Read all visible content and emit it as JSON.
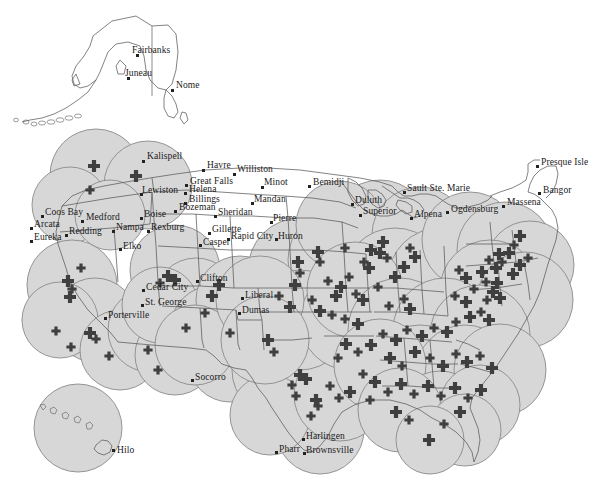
{
  "map": {
    "title": "United States Service Coverage Map",
    "type": "coverage-buffer-map",
    "colors": {
      "buffer_fill": "#d7d7d7",
      "buffer_stroke": "#8a8a8a",
      "state_boundary": "#555555",
      "marker": "#3f3f3f",
      "background": "#ffffff",
      "label_text": "#1a1a1a"
    },
    "legend_note": "",
    "insets": [
      {
        "name": "alaska",
        "label": ""
      },
      {
        "name": "hawaii",
        "label": ""
      }
    ],
    "marker_symbol": "cross",
    "marker_count": 143,
    "labeled_cities": [
      {
        "name": "Fairbanks",
        "x": 137,
        "y": 55,
        "dx": -5,
        "dy": -9,
        "region": "alaska"
      },
      {
        "name": "Juneau",
        "x": 128,
        "y": 78,
        "dx": -3,
        "dy": -9,
        "region": "alaska"
      },
      {
        "name": "Nome",
        "x": 172,
        "y": 90,
        "dx": 4,
        "dy": -9,
        "region": "alaska"
      },
      {
        "name": "Hilo",
        "x": 113,
        "y": 450,
        "dx": 4,
        "dy": -4,
        "region": "hawaii"
      },
      {
        "name": "Kalispell",
        "x": 143,
        "y": 161,
        "dx": 4,
        "dy": -9,
        "region": "west"
      },
      {
        "name": "Havre",
        "x": 203,
        "y": 170,
        "dx": 4,
        "dy": -9,
        "region": "west"
      },
      {
        "name": "Williston",
        "x": 234,
        "y": 174,
        "dx": 3,
        "dy": -9,
        "region": "west"
      },
      {
        "name": "Great Falls",
        "x": 186,
        "y": 185,
        "dx": 4,
        "dy": -8,
        "region": "west"
      },
      {
        "name": "Helena",
        "x": 185,
        "y": 193,
        "dx": 4,
        "dy": -8,
        "region": "west"
      },
      {
        "name": "Lewiston",
        "x": 141,
        "y": 194,
        "dx": 1,
        "dy": -8,
        "region": "west"
      },
      {
        "name": "Billings",
        "x": 185,
        "y": 203,
        "dx": 4,
        "dy": -8,
        "region": "west"
      },
      {
        "name": "Bozeman",
        "x": 175,
        "y": 211,
        "dx": 4,
        "dy": -8,
        "region": "west"
      },
      {
        "name": "Minot",
        "x": 262,
        "y": 187,
        "dx": 2,
        "dy": -9,
        "region": "west"
      },
      {
        "name": "Mandan",
        "x": 252,
        "y": 203,
        "dx": 2,
        "dy": -8,
        "region": "west"
      },
      {
        "name": "Bemidji",
        "x": 309,
        "y": 186,
        "dx": 4,
        "dy": -8,
        "region": "midwest"
      },
      {
        "name": "Sheridan",
        "x": 215,
        "y": 216,
        "dx": 3,
        "dy": -8,
        "region": "west"
      },
      {
        "name": "Sault Ste. Marie",
        "x": 404,
        "y": 192,
        "dx": 3,
        "dy": -8,
        "region": "midwest"
      },
      {
        "name": "Presque Isle",
        "x": 537,
        "y": 166,
        "dx": 4,
        "dy": -8,
        "region": "northeast"
      },
      {
        "name": "Bangor",
        "x": 539,
        "y": 193,
        "dx": 4,
        "dy": -7,
        "region": "northeast"
      },
      {
        "name": "Duluth",
        "x": 352,
        "y": 204,
        "dx": 3,
        "dy": -8,
        "region": "midwest"
      },
      {
        "name": "Superior",
        "x": 360,
        "y": 215,
        "dx": 3,
        "dy": -8,
        "region": "midwest"
      },
      {
        "name": "Alpena",
        "x": 411,
        "y": 218,
        "dx": 3,
        "dy": -8,
        "region": "midwest"
      },
      {
        "name": "Ogdensburg",
        "x": 447,
        "y": 212,
        "dx": 4,
        "dy": -7,
        "region": "northeast"
      },
      {
        "name": "Massena",
        "x": 503,
        "y": 206,
        "dx": 4,
        "dy": -8,
        "region": "northeast"
      },
      {
        "name": "Coos Bay",
        "x": 42,
        "y": 216,
        "dx": 3,
        "dy": -8,
        "region": "west"
      },
      {
        "name": "Medford",
        "x": 82,
        "y": 221,
        "dx": 4,
        "dy": -8,
        "region": "west"
      },
      {
        "name": "Boise",
        "x": 141,
        "y": 218,
        "dx": 3,
        "dy": -8,
        "region": "west"
      },
      {
        "name": "Arcata",
        "x": 31,
        "y": 228,
        "dx": 3,
        "dy": -8,
        "region": "west"
      },
      {
        "name": "Redding",
        "x": 66,
        "y": 235,
        "dx": 3,
        "dy": -8,
        "region": "west"
      },
      {
        "name": "Nampa",
        "x": 113,
        "y": 231,
        "dx": 3,
        "dy": -8,
        "region": "west"
      },
      {
        "name": "Rexburg",
        "x": 148,
        "y": 231,
        "dx": 3,
        "dy": -8,
        "region": "west"
      },
      {
        "name": "Eureka",
        "x": 31,
        "y": 241,
        "dx": 3,
        "dy": -8,
        "region": "west"
      },
      {
        "name": "Gillette",
        "x": 209,
        "y": 233,
        "dx": 3,
        "dy": -8,
        "region": "west"
      },
      {
        "name": "Pierre",
        "x": 271,
        "y": 222,
        "dx": 2,
        "dy": -8,
        "region": "west"
      },
      {
        "name": "Rapid City",
        "x": 228,
        "y": 239,
        "dx": 3,
        "dy": -7,
        "region": "west"
      },
      {
        "name": "Huron",
        "x": 276,
        "y": 239,
        "dx": 2,
        "dy": -7,
        "region": "west"
      },
      {
        "name": "Casper",
        "x": 200,
        "y": 245,
        "dx": 3,
        "dy": -7,
        "region": "west"
      },
      {
        "name": "Elko",
        "x": 120,
        "y": 249,
        "dx": 3,
        "dy": -7,
        "region": "west"
      },
      {
        "name": "Cedar City",
        "x": 143,
        "y": 290,
        "dx": 3,
        "dy": -7,
        "region": "west"
      },
      {
        "name": "Clifton",
        "x": 197,
        "y": 281,
        "dx": 3,
        "dy": -7,
        "region": "southwest"
      },
      {
        "name": "Liberal",
        "x": 242,
        "y": 298,
        "dx": 3,
        "dy": -7,
        "region": "plains"
      },
      {
        "name": "St. George",
        "x": 142,
        "y": 305,
        "dx": 3,
        "dy": -7,
        "region": "west"
      },
      {
        "name": "Dumas",
        "x": 239,
        "y": 313,
        "dx": 3,
        "dy": -7,
        "region": "plains"
      },
      {
        "name": "Porterville",
        "x": 105,
        "y": 318,
        "dx": 3,
        "dy": -7,
        "region": "west"
      },
      {
        "name": "Socorro",
        "x": 192,
        "y": 380,
        "dx": 3,
        "dy": -7,
        "region": "southwest"
      },
      {
        "name": "Harlingen",
        "x": 303,
        "y": 439,
        "dx": 3,
        "dy": -7,
        "region": "south"
      },
      {
        "name": "Pharr",
        "x": 276,
        "y": 452,
        "dx": 0,
        "dy": -7,
        "region": "south"
      },
      {
        "name": "Brownsville",
        "x": 304,
        "y": 453,
        "dx": 2,
        "dy": -7,
        "region": "south"
      }
    ]
  },
  "chart_data": {
    "type": "map",
    "regions_labeled": 48,
    "marker_points": 143
  }
}
